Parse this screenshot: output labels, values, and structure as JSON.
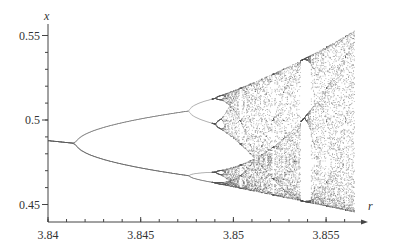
{
  "chart_data": {
    "type": "scatter",
    "title": "",
    "subtitle": "Bifurcation diagram of the logistic map (period-doubling cascade into chaos)",
    "xlabel": "r",
    "ylabel": "x",
    "xlim": [
      3.84,
      3.8565
    ],
    "ylim": [
      0.45,
      0.555
    ],
    "grid": false,
    "legend": null,
    "x_ticks": [
      3.84,
      3.845,
      3.85,
      3.855
    ],
    "x_tick_labels": [
      "3.84",
      "3.845",
      "3.85",
      "3.855"
    ],
    "x_minor_step": 0.001,
    "y_ticks": [
      0.45,
      0.5,
      0.55
    ],
    "y_tick_labels": [
      "0.45",
      "0.5",
      "0.55"
    ],
    "y_minor_step": 0.01,
    "bifurcation_points": [
      {
        "r": 3.8415,
        "x": 0.487,
        "from_period": 1,
        "to_period": 2
      },
      {
        "r": 3.8476,
        "x_upper": 0.507,
        "x_lower": 0.469,
        "from_period": 2,
        "to_period": 4
      },
      {
        "r": 3.8488,
        "from_period": 4,
        "to_period": 8
      }
    ],
    "branches": [
      {
        "name": "period-1",
        "points": [
          [
            3.84,
            0.489
          ],
          [
            3.8415,
            0.487
          ]
        ]
      },
      {
        "name": "period-2 upper",
        "points": [
          [
            3.8415,
            0.487
          ],
          [
            3.843,
            0.496
          ],
          [
            3.845,
            0.502
          ],
          [
            3.8476,
            0.507
          ]
        ]
      },
      {
        "name": "period-2 lower",
        "points": [
          [
            3.8415,
            0.487
          ],
          [
            3.843,
            0.478
          ],
          [
            3.845,
            0.472
          ],
          [
            3.8476,
            0.469
          ]
        ]
      }
    ],
    "chaotic_region": {
      "r_start": 3.8493,
      "r_end": 3.8565,
      "upper_envelope": [
        [
          3.8493,
          0.515
        ],
        [
          3.852,
          0.527
        ],
        [
          3.8565,
          0.554
        ]
      ],
      "lower_envelope": [
        [
          3.8493,
          0.463
        ],
        [
          3.852,
          0.457
        ],
        [
          3.8565,
          0.444
        ]
      ],
      "periodic_windows_r": [
        3.8513,
        3.8535
      ]
    },
    "point_color": "#555555"
  }
}
